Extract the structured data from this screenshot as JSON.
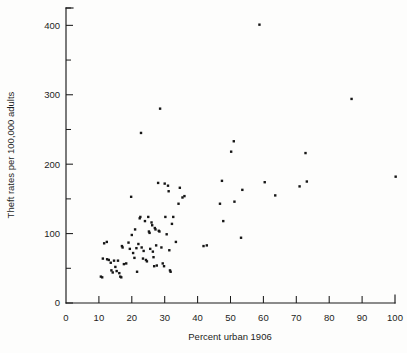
{
  "chart_data": {
    "type": "scatter",
    "title": "",
    "xlabel": "Percent urban 1906",
    "ylabel": "Theft rates per 100,000 adults",
    "xlim": [
      0,
      100
    ],
    "ylim": [
      0,
      425
    ],
    "grid": false,
    "legend": null,
    "x_ticks": [
      0,
      10,
      20,
      30,
      40,
      50,
      60,
      70,
      80,
      90,
      100
    ],
    "x_tick_labels": [
      "0",
      "10",
      "20",
      "30",
      "40",
      "50",
      "60",
      "70",
      "80",
      "90",
      "100"
    ],
    "y_ticks": [
      0,
      100,
      200,
      300,
      400
    ],
    "y_tick_labels": [
      "0",
      "100",
      "200",
      "300",
      "400"
    ],
    "y_minor_ticks": [
      50,
      150,
      250,
      350,
      425
    ],
    "marker": "square",
    "marker_size": 2.4,
    "marker_color": "#161616",
    "points": [
      {
        "x": 10.6,
        "y": 38
      },
      {
        "x": 11.0,
        "y": 37
      },
      {
        "x": 11.2,
        "y": 64
      },
      {
        "x": 11.6,
        "y": 86
      },
      {
        "x": 12.4,
        "y": 88
      },
      {
        "x": 12.5,
        "y": 63
      },
      {
        "x": 13.0,
        "y": 62
      },
      {
        "x": 13.6,
        "y": 58
      },
      {
        "x": 13.8,
        "y": 47
      },
      {
        "x": 14.2,
        "y": 44
      },
      {
        "x": 14.6,
        "y": 61
      },
      {
        "x": 15.0,
        "y": 52
      },
      {
        "x": 15.4,
        "y": 46
      },
      {
        "x": 15.8,
        "y": 61
      },
      {
        "x": 16.2,
        "y": 43
      },
      {
        "x": 16.5,
        "y": 38
      },
      {
        "x": 16.8,
        "y": 37
      },
      {
        "x": 17.0,
        "y": 82
      },
      {
        "x": 17.2,
        "y": 80
      },
      {
        "x": 17.6,
        "y": 56
      },
      {
        "x": 18.3,
        "y": 57
      },
      {
        "x": 19.0,
        "y": 87
      },
      {
        "x": 19.4,
        "y": 78
      },
      {
        "x": 19.8,
        "y": 153
      },
      {
        "x": 20.0,
        "y": 98
      },
      {
        "x": 20.4,
        "y": 72
      },
      {
        "x": 20.8,
        "y": 65
      },
      {
        "x": 21.0,
        "y": 106
      },
      {
        "x": 21.4,
        "y": 79
      },
      {
        "x": 21.6,
        "y": 45
      },
      {
        "x": 22.0,
        "y": 85
      },
      {
        "x": 22.4,
        "y": 122
      },
      {
        "x": 22.6,
        "y": 124
      },
      {
        "x": 22.8,
        "y": 245
      },
      {
        "x": 23.0,
        "y": 80
      },
      {
        "x": 23.4,
        "y": 64
      },
      {
        "x": 23.6,
        "y": 75
      },
      {
        "x": 24.0,
        "y": 118
      },
      {
        "x": 24.3,
        "y": 62
      },
      {
        "x": 24.6,
        "y": 60
      },
      {
        "x": 25.0,
        "y": 124
      },
      {
        "x": 25.2,
        "y": 103
      },
      {
        "x": 25.4,
        "y": 101
      },
      {
        "x": 25.6,
        "y": 78
      },
      {
        "x": 26.0,
        "y": 116
      },
      {
        "x": 26.2,
        "y": 112
      },
      {
        "x": 26.4,
        "y": 74
      },
      {
        "x": 26.6,
        "y": 66
      },
      {
        "x": 26.8,
        "y": 53
      },
      {
        "x": 27.0,
        "y": 108
      },
      {
        "x": 27.2,
        "y": 106
      },
      {
        "x": 27.4,
        "y": 83
      },
      {
        "x": 27.6,
        "y": 54
      },
      {
        "x": 28.0,
        "y": 173
      },
      {
        "x": 28.2,
        "y": 104
      },
      {
        "x": 28.4,
        "y": 103
      },
      {
        "x": 28.6,
        "y": 280
      },
      {
        "x": 29.0,
        "y": 80
      },
      {
        "x": 29.4,
        "y": 57
      },
      {
        "x": 29.8,
        "y": 53
      },
      {
        "x": 30.0,
        "y": 172
      },
      {
        "x": 30.2,
        "y": 124
      },
      {
        "x": 30.6,
        "y": 99
      },
      {
        "x": 31.0,
        "y": 169
      },
      {
        "x": 31.2,
        "y": 161
      },
      {
        "x": 31.4,
        "y": 76
      },
      {
        "x": 31.6,
        "y": 47
      },
      {
        "x": 31.8,
        "y": 45
      },
      {
        "x": 32.2,
        "y": 114
      },
      {
        "x": 32.6,
        "y": 124
      },
      {
        "x": 33.4,
        "y": 88
      },
      {
        "x": 34.2,
        "y": 143
      },
      {
        "x": 34.6,
        "y": 166
      },
      {
        "x": 35.4,
        "y": 152
      },
      {
        "x": 36.0,
        "y": 154
      },
      {
        "x": 41.8,
        "y": 82
      },
      {
        "x": 42.8,
        "y": 83
      },
      {
        "x": 46.8,
        "y": 143
      },
      {
        "x": 47.4,
        "y": 176
      },
      {
        "x": 47.8,
        "y": 118
      },
      {
        "x": 50.2,
        "y": 218
      },
      {
        "x": 51.0,
        "y": 233
      },
      {
        "x": 51.2,
        "y": 146
      },
      {
        "x": 53.2,
        "y": 94
      },
      {
        "x": 53.6,
        "y": 163
      },
      {
        "x": 58.8,
        "y": 401
      },
      {
        "x": 60.4,
        "y": 174
      },
      {
        "x": 63.6,
        "y": 155
      },
      {
        "x": 71.0,
        "y": 168
      },
      {
        "x": 72.8,
        "y": 216
      },
      {
        "x": 73.2,
        "y": 175
      },
      {
        "x": 86.8,
        "y": 294
      },
      {
        "x": 100.2,
        "y": 182
      }
    ]
  },
  "figure": {
    "xlabel": "Percent urban 1906",
    "ylabel": "Theft rates per 100,000 adults"
  }
}
